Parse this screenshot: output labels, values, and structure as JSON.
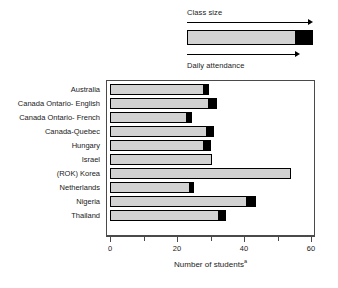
{
  "legend": {
    "top_label": "Class size",
    "bottom_label": "Daily attendance",
    "top_arrow_icon": "arrow-right-icon",
    "bottom_arrow_icon": "arrow-right-icon",
    "bar_fill_color": "#d2d2d2",
    "bar_tip_color": "#000000"
  },
  "axis": {
    "x_title": "Number of students",
    "x_title_superscript": "a",
    "tick_labels": [
      "0",
      "20",
      "40",
      "60"
    ]
  },
  "chart_data": {
    "type": "bar",
    "orientation": "horizontal",
    "title": "",
    "subtitle": "",
    "xlabel": "Number of students",
    "ylabel": "",
    "xlim": [
      0,
      60
    ],
    "xticks": [
      0,
      20,
      40,
      60
    ],
    "xminorticks": [
      10,
      30,
      50
    ],
    "grid": false,
    "legend_position": "above-plot",
    "legend_entries": [
      "Class size",
      "Daily attendance"
    ],
    "note": "Each bar shows daily attendance (grey) extending to class size (black tip at end).",
    "categories": [
      "Australia",
      "Canada Ontario-  English",
      "Canada Ontario-  French",
      "Canada-Quebec",
      "Hungary",
      "Israel",
      "(ROK) Korea",
      "Netherlands",
      "Nigeria",
      "Thailand"
    ],
    "series": [
      {
        "name": "Daily attendance",
        "color": "#d2d2d2",
        "values": [
          28,
          29.5,
          23,
          29,
          28,
          30.5,
          54,
          24,
          41,
          32.5
        ]
      },
      {
        "name": "Class size",
        "color": "#000000",
        "values": [
          29.5,
          32,
          24.5,
          31,
          30,
          30.5,
          54,
          25,
          43.5,
          34.5
        ]
      }
    ]
  }
}
